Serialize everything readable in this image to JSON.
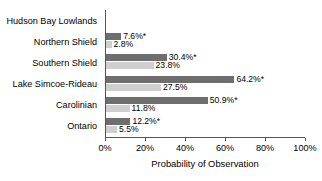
{
  "chart_data": {
    "type": "bar",
    "orientation": "horizontal",
    "title": "",
    "xlabel": "Probability of Observation",
    "ylabel": "",
    "xlim": [
      0,
      100
    ],
    "xticks": [
      0,
      20,
      40,
      60,
      80,
      100
    ],
    "xtick_labels": [
      "0%",
      "20%",
      "40%",
      "60%",
      "80%",
      "100%"
    ],
    "grid": false,
    "legend": "none",
    "value_suffix": "%",
    "significance_marker": "*",
    "categories": [
      "Hudson Bay Lowlands",
      "Northern Shield",
      "Southern Shield",
      "Lake Simcoe-Rideau",
      "Carolinian",
      "Ontario"
    ],
    "series": [
      {
        "name": "series-1",
        "color": "#6e6e6e",
        "values": [
          null,
          7.6,
          30.4,
          64.2,
          50.9,
          12.2
        ],
        "labels": [
          "",
          "7.6%*",
          "30.4%*",
          "64.2%*",
          "50.9%*",
          "12.2%*"
        ]
      },
      {
        "name": "series-2",
        "color": "#cfcfcf",
        "values": [
          null,
          2.8,
          23.8,
          27.5,
          11.8,
          5.5
        ],
        "labels": [
          "",
          "2.8%",
          "23.8%",
          "27.5%",
          "11.8%",
          "5.5%"
        ]
      }
    ]
  }
}
